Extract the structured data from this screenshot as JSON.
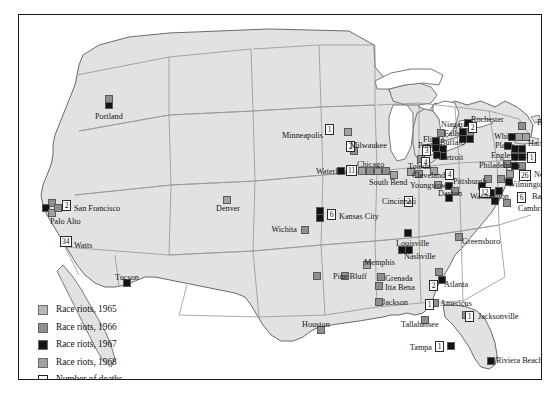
{
  "figure": {
    "frame": {
      "border_color": "#1a1a1a"
    },
    "colors": {
      "land": "#e2e2e2",
      "water": "#ffffff",
      "state_border": "#8c8c8c",
      "coast": "#5f5f5f",
      "y1965": "#b9b9b9",
      "y1966": "#8f8f8f",
      "y1967": "#141414",
      "y1968": "#a2a2a2"
    }
  },
  "legend": {
    "items": [
      {
        "label": "Race riots, 1965",
        "swatch": "y1965",
        "color": "#b9b9b9"
      },
      {
        "label": "Race riots, 1966",
        "swatch": "y1966",
        "color": "#8f8f8f"
      },
      {
        "label": "Race riots, 1967",
        "swatch": "y1967",
        "color": "#141414"
      },
      {
        "label": "Race riots, 1968",
        "swatch": "y1968",
        "color": "#a2a2a2"
      },
      {
        "label": "Number of deaths",
        "swatch": "open",
        "color": "#ffffff"
      }
    ]
  },
  "chart_data": {
    "type": "map",
    "legend_position": "bottom-left",
    "categories": [
      "Race riots, 1965",
      "Race riots, 1966",
      "Race riots, 1967",
      "Race riots, 1968",
      "Number of deaths"
    ],
    "cities": [
      {
        "name": "Portland",
        "deaths": null,
        "label_pos": "below"
      },
      {
        "name": "San Francisco",
        "deaths": "2",
        "label_pos": "right"
      },
      {
        "name": "Palo Alto",
        "deaths": null,
        "label_pos": "below"
      },
      {
        "name": "Watts",
        "deaths": "34",
        "label_pos": "right"
      },
      {
        "name": "Tucson",
        "deaths": null,
        "label_pos": "above"
      },
      {
        "name": "Denver",
        "deaths": null,
        "label_pos": "below"
      },
      {
        "name": "Wichita",
        "deaths": null,
        "label_pos": "left"
      },
      {
        "name": "Kansas City",
        "deaths": "6",
        "label_pos": "right"
      },
      {
        "name": "Minneapolis",
        "deaths": "1",
        "label_pos": "left"
      },
      {
        "name": "Milwaukee",
        "deaths": null,
        "label_pos": "left"
      },
      {
        "name": "Waterloo",
        "deaths": null,
        "label_pos": "left"
      },
      {
        "name": "Chicago",
        "deaths": "11",
        "label_pos": "above"
      },
      {
        "name": "South Bend",
        "deaths": null,
        "label_pos": "below"
      },
      {
        "name": "Pontiac",
        "deaths": "3",
        "label_pos": "left"
      },
      {
        "name": "Flint",
        "deaths": null,
        "label_pos": "left"
      },
      {
        "name": "Detroit",
        "deaths": "43",
        "label_pos": "right"
      },
      {
        "name": "Toledo",
        "deaths": null,
        "label_pos": "left"
      },
      {
        "name": "Cleveland",
        "deaths": "4",
        "label_pos": "left"
      },
      {
        "name": "Youngstown",
        "deaths": null,
        "label_pos": "below"
      },
      {
        "name": "Cincinnati",
        "deaths": "2",
        "label_pos": "left"
      },
      {
        "name": "Dayton",
        "deaths": null,
        "label_pos": "right"
      },
      {
        "name": "Louisville",
        "deaths": null,
        "label_pos": "right"
      },
      {
        "name": "Niagara Falls",
        "deaths": null,
        "label_pos": "left"
      },
      {
        "name": "Buffalo",
        "deaths": null,
        "label_pos": "left"
      },
      {
        "name": "Rochester",
        "deaths": "2",
        "label_pos": "above"
      },
      {
        "name": "Boston",
        "deaths": null,
        "label_pos": "right"
      },
      {
        "name": "Hartford",
        "deaths": null,
        "label_pos": "right"
      },
      {
        "name": "White Plains",
        "deaths": null,
        "label_pos": "left"
      },
      {
        "name": "New York",
        "deaths": "1",
        "label_pos": "right"
      },
      {
        "name": "Englewood",
        "deaths": null,
        "label_pos": "left"
      },
      {
        "name": "Newark",
        "deaths": "26",
        "label_pos": "right"
      },
      {
        "name": "Philadelphia",
        "deaths": null,
        "label_pos": "left"
      },
      {
        "name": "Pittsburgh",
        "deaths": null,
        "label_pos": "left"
      },
      {
        "name": "Wilmington",
        "deaths": null,
        "label_pos": "right"
      },
      {
        "name": "Washington",
        "deaths": "12",
        "label_pos": "left"
      },
      {
        "name": "Baltimore",
        "deaths": "6",
        "label_pos": "right"
      },
      {
        "name": "Cambridge",
        "deaths": null,
        "label_pos": "right"
      },
      {
        "name": "Greensboro",
        "deaths": null,
        "label_pos": "right"
      },
      {
        "name": "Nashville",
        "deaths": null,
        "label_pos": "below"
      },
      {
        "name": "Memphis",
        "deaths": null,
        "label_pos": "left"
      },
      {
        "name": "Pine Bluff",
        "deaths": null,
        "label_pos": "left"
      },
      {
        "name": "Grenada",
        "deaths": null,
        "label_pos": "right"
      },
      {
        "name": "Itta Bena",
        "deaths": null,
        "label_pos": "right"
      },
      {
        "name": "Jackson",
        "deaths": null,
        "label_pos": "right"
      },
      {
        "name": "Houston",
        "deaths": null,
        "label_pos": "above"
      },
      {
        "name": "Atlanta",
        "deaths": "2",
        "label_pos": "right"
      },
      {
        "name": "Americus",
        "deaths": "1",
        "label_pos": "right"
      },
      {
        "name": "Tallahassee",
        "deaths": null,
        "label_pos": "left"
      },
      {
        "name": "Jacksonville",
        "deaths": "1",
        "label_pos": "right"
      },
      {
        "name": "Tampa",
        "deaths": "1",
        "label_pos": "left"
      },
      {
        "name": "Riviera Beach",
        "deaths": null,
        "label_pos": "right"
      }
    ],
    "labels": [
      {
        "text": "Portland",
        "x": 76,
        "y": 97,
        "align": "left"
      },
      {
        "text": "San Francisco",
        "x": 55,
        "y": 189,
        "align": "left"
      },
      {
        "text": "Palo Alto",
        "x": 31,
        "y": 202,
        "align": "left"
      },
      {
        "text": "Watts",
        "x": 55,
        "y": 226,
        "align": "left"
      },
      {
        "text": "Tucson",
        "x": 96,
        "y": 258,
        "align": "left"
      },
      {
        "text": "Denver",
        "x": 197,
        "y": 189,
        "align": "left"
      },
      {
        "text": "Wichita",
        "x": 278,
        "y": 210,
        "align": "right"
      },
      {
        "text": "Kansas City",
        "x": 320,
        "y": 197,
        "align": "left"
      },
      {
        "text": "Minneapolis",
        "x": 304,
        "y": 116,
        "align": "right"
      },
      {
        "text": "Milwaukee",
        "x": 331,
        "y": 126,
        "align": "left"
      },
      {
        "text": "Waterloo",
        "x": 297,
        "y": 152,
        "align": "left"
      },
      {
        "text": "Chicago",
        "x": 338,
        "y": 145,
        "align": "left"
      },
      {
        "text": "South Bend",
        "x": 350,
        "y": 163,
        "align": "left"
      },
      {
        "text": "Pontiac",
        "x": 399,
        "y": 126,
        "align": "left"
      },
      {
        "text": "Flint",
        "x": 404,
        "y": 120,
        "align": "left"
      },
      {
        "text": "Detroit",
        "x": 421,
        "y": 138,
        "align": "left"
      },
      {
        "text": "Toledo",
        "x": 389,
        "y": 147,
        "align": "left"
      },
      {
        "text": "Cleveland",
        "x": 393,
        "y": 156,
        "align": "left"
      },
      {
        "text": "Youngstown",
        "x": 391,
        "y": 166,
        "align": "left"
      },
      {
        "text": "Cincinnati",
        "x": 363,
        "y": 182,
        "align": "left"
      },
      {
        "text": "Dayton",
        "x": 419,
        "y": 174,
        "align": "left"
      },
      {
        "text": "Louisville",
        "x": 377,
        "y": 224,
        "align": "left"
      },
      {
        "text": "Niagara",
        "x": 422,
        "y": 105,
        "align": "left"
      },
      {
        "text": "Falls",
        "x": 425,
        "y": 114,
        "align": "left"
      },
      {
        "text": "Buffalo",
        "x": 421,
        "y": 123,
        "align": "left"
      },
      {
        "text": "Rochester",
        "x": 452,
        "y": 100,
        "align": "left"
      },
      {
        "text": "Boston",
        "x": 518,
        "y": 103,
        "align": "left"
      },
      {
        "text": "Hartford",
        "x": 509,
        "y": 124,
        "align": "left"
      },
      {
        "text": "White",
        "x": 475,
        "y": 117,
        "align": "left"
      },
      {
        "text": "Plains",
        "x": 476,
        "y": 126,
        "align": "left"
      },
      {
        "text": "New",
        "x": 523,
        "y": 136,
        "align": "left"
      },
      {
        "text": "York",
        "x": 523,
        "y": 145,
        "align": "left"
      },
      {
        "text": "Englewood",
        "x": 472,
        "y": 136,
        "align": "left"
      },
      {
        "text": "Newark",
        "x": 515,
        "y": 155,
        "align": "left"
      },
      {
        "text": "Philadelphia",
        "x": 460,
        "y": 146,
        "align": "left"
      },
      {
        "text": "Pittsburgh",
        "x": 434,
        "y": 162,
        "align": "left"
      },
      {
        "text": "Wilmington",
        "x": 489,
        "y": 165,
        "align": "left"
      },
      {
        "text": "Washington",
        "x": 451,
        "y": 177,
        "align": "left"
      },
      {
        "text": "Baltimore",
        "x": 513,
        "y": 177,
        "align": "left"
      },
      {
        "text": "Cambridge",
        "x": 499,
        "y": 189,
        "align": "left"
      },
      {
        "text": "Greensboro",
        "x": 443,
        "y": 222,
        "align": "left"
      },
      {
        "text": "Nashville",
        "x": 385,
        "y": 237,
        "align": "left"
      },
      {
        "text": "Memphis",
        "x": 345,
        "y": 243,
        "align": "left"
      },
      {
        "text": "Pine Bluff",
        "x": 314,
        "y": 257,
        "align": "left"
      },
      {
        "text": "Grenada",
        "x": 366,
        "y": 259,
        "align": "left"
      },
      {
        "text": "Itta Bena",
        "x": 366,
        "y": 268,
        "align": "left"
      },
      {
        "text": "Jackson",
        "x": 363,
        "y": 283,
        "align": "left"
      },
      {
        "text": "Houston",
        "x": 283,
        "y": 305,
        "align": "left"
      },
      {
        "text": "Atlanta",
        "x": 425,
        "y": 265,
        "align": "left"
      },
      {
        "text": "Americus",
        "x": 421,
        "y": 284,
        "align": "left"
      },
      {
        "text": "Tallahassee",
        "x": 382,
        "y": 305,
        "align": "left"
      },
      {
        "text": "Jacksonville",
        "x": 459,
        "y": 297,
        "align": "left"
      },
      {
        "text": "Tampa",
        "x": 413,
        "y": 328,
        "align": "right"
      },
      {
        "text": "Riviera Beach",
        "x": 477,
        "y": 341,
        "align": "left"
      }
    ],
    "markers": [
      {
        "x": 86,
        "y": 86,
        "c": "y1967"
      },
      {
        "x": 86,
        "y": 80,
        "c": "y1966"
      },
      {
        "x": 29,
        "y": 184,
        "c": "y1966"
      },
      {
        "x": 23,
        "y": 189,
        "c": "y1967"
      },
      {
        "x": 29,
        "y": 194,
        "c": "y1968"
      },
      {
        "x": 35,
        "y": 189,
        "c": "y1966"
      },
      {
        "x": 45,
        "y": 221,
        "c": "y1966"
      },
      {
        "x": 104,
        "y": 264,
        "c": "y1967"
      },
      {
        "x": 204,
        "y": 181,
        "c": "y1968"
      },
      {
        "x": 282,
        "y": 211,
        "c": "y1966"
      },
      {
        "x": 297,
        "y": 192,
        "c": "y1967"
      },
      {
        "x": 297,
        "y": 199,
        "c": "y1967"
      },
      {
        "x": 306,
        "y": 110,
        "c": "y1966"
      },
      {
        "x": 325,
        "y": 113,
        "c": "y1968"
      },
      {
        "x": 331,
        "y": 132,
        "c": "y1966"
      },
      {
        "x": 318,
        "y": 152,
        "c": "y1967"
      },
      {
        "x": 339,
        "y": 152,
        "c": "y1968"
      },
      {
        "x": 347,
        "y": 152,
        "c": "y1966"
      },
      {
        "x": 355,
        "y": 152,
        "c": "y1968"
      },
      {
        "x": 363,
        "y": 152,
        "c": "y1966"
      },
      {
        "x": 371,
        "y": 156,
        "c": "y1968"
      },
      {
        "x": 398,
        "y": 140,
        "c": "y1966"
      },
      {
        "x": 388,
        "y": 153,
        "c": "y1968"
      },
      {
        "x": 396,
        "y": 155,
        "c": "y1966"
      },
      {
        "x": 411,
        "y": 152,
        "c": "y1968"
      },
      {
        "x": 418,
        "y": 114,
        "c": "y1966"
      },
      {
        "x": 413,
        "y": 122,
        "c": "y1967"
      },
      {
        "x": 413,
        "y": 129,
        "c": "y1967"
      },
      {
        "x": 420,
        "y": 130,
        "c": "y1967"
      },
      {
        "x": 420,
        "y": 137,
        "c": "y1967"
      },
      {
        "x": 414,
        "y": 136,
        "c": "y1967"
      },
      {
        "x": 415,
        "y": 166,
        "c": "y1968"
      },
      {
        "x": 426,
        "y": 167,
        "c": "y1967"
      },
      {
        "x": 432,
        "y": 172,
        "c": "y1966"
      },
      {
        "x": 426,
        "y": 179,
        "c": "y1967"
      },
      {
        "x": 385,
        "y": 184,
        "c": "y1967"
      },
      {
        "x": 385,
        "y": 214,
        "c": "y1967"
      },
      {
        "x": 445,
        "y": 104,
        "c": "y1967"
      },
      {
        "x": 440,
        "y": 113,
        "c": "y1967"
      },
      {
        "x": 447,
        "y": 113,
        "c": "y1966"
      },
      {
        "x": 440,
        "y": 120,
        "c": "y1967"
      },
      {
        "x": 447,
        "y": 120,
        "c": "y1967"
      },
      {
        "x": 499,
        "y": 107,
        "c": "y1966"
      },
      {
        "x": 489,
        "y": 118,
        "c": "y1967"
      },
      {
        "x": 496,
        "y": 118,
        "c": "y1968"
      },
      {
        "x": 503,
        "y": 118,
        "c": "y1968"
      },
      {
        "x": 485,
        "y": 127,
        "c": "y1967"
      },
      {
        "x": 492,
        "y": 130,
        "c": "y1967"
      },
      {
        "x": 499,
        "y": 130,
        "c": "y1967"
      },
      {
        "x": 492,
        "y": 138,
        "c": "y1967"
      },
      {
        "x": 499,
        "y": 138,
        "c": "y1967"
      },
      {
        "x": 484,
        "y": 145,
        "c": "y1966"
      },
      {
        "x": 492,
        "y": 147,
        "c": "y1967"
      },
      {
        "x": 499,
        "y": 147,
        "c": "y1966"
      },
      {
        "x": 487,
        "y": 155,
        "c": "y1968"
      },
      {
        "x": 478,
        "y": 160,
        "c": "y1966"
      },
      {
        "x": 486,
        "y": 163,
        "c": "y1967"
      },
      {
        "x": 465,
        "y": 160,
        "c": "y1966"
      },
      {
        "x": 459,
        "y": 167,
        "c": "y1967"
      },
      {
        "x": 468,
        "y": 174,
        "c": "y1967"
      },
      {
        "x": 476,
        "y": 172,
        "c": "y1967"
      },
      {
        "x": 472,
        "y": 182,
        "c": "y1967"
      },
      {
        "x": 484,
        "y": 184,
        "c": "y1966"
      },
      {
        "x": 436,
        "y": 218,
        "c": "y1966"
      },
      {
        "x": 379,
        "y": 231,
        "c": "y1967"
      },
      {
        "x": 386,
        "y": 231,
        "c": "y1967"
      },
      {
        "x": 344,
        "y": 246,
        "c": "y1968"
      },
      {
        "x": 322,
        "y": 257,
        "c": "y1966"
      },
      {
        "x": 294,
        "y": 257,
        "c": "y1966"
      },
      {
        "x": 358,
        "y": 258,
        "c": "y1966"
      },
      {
        "x": 356,
        "y": 267,
        "c": "y1966"
      },
      {
        "x": 356,
        "y": 283,
        "c": "y1966"
      },
      {
        "x": 298,
        "y": 311,
        "c": "y1966"
      },
      {
        "x": 416,
        "y": 253,
        "c": "y1966"
      },
      {
        "x": 419,
        "y": 261,
        "c": "y1967"
      },
      {
        "x": 412,
        "y": 284,
        "c": "y1966"
      },
      {
        "x": 402,
        "y": 301,
        "c": "y1966"
      },
      {
        "x": 443,
        "y": 296,
        "c": "y1966"
      },
      {
        "x": 428,
        "y": 327,
        "c": "y1967"
      },
      {
        "x": 468,
        "y": 342,
        "c": "y1967"
      }
    ],
    "death_boxes": [
      {
        "x": 43,
        "y": 185,
        "v": "2"
      },
      {
        "x": 41,
        "y": 221,
        "v": "34"
      },
      {
        "x": 306,
        "y": 109,
        "v": "1"
      },
      {
        "x": 308,
        "y": 194,
        "v": "6"
      },
      {
        "x": 327,
        "y": 150,
        "v": "11"
      },
      {
        "x": 327,
        "y": 126,
        "v": "2"
      },
      {
        "x": 403,
        "y": 130,
        "v": "3"
      },
      {
        "x": 402,
        "y": 142,
        "v": "4"
      },
      {
        "x": 426,
        "y": 154,
        "v": "4"
      },
      {
        "x": 385,
        "y": 181,
        "v": "2"
      },
      {
        "x": 449,
        "y": 107,
        "v": "2"
      },
      {
        "x": 508,
        "y": 137,
        "v": "1"
      },
      {
        "x": 500,
        "y": 155,
        "v": "26"
      },
      {
        "x": 498,
        "y": 177,
        "v": "6"
      },
      {
        "x": 460,
        "y": 172,
        "v": "12"
      },
      {
        "x": 410,
        "y": 265,
        "v": "2"
      },
      {
        "x": 406,
        "y": 284,
        "v": "1"
      },
      {
        "x": 446,
        "y": 296,
        "v": "1"
      },
      {
        "x": 416,
        "y": 326,
        "v": "1"
      }
    ]
  }
}
